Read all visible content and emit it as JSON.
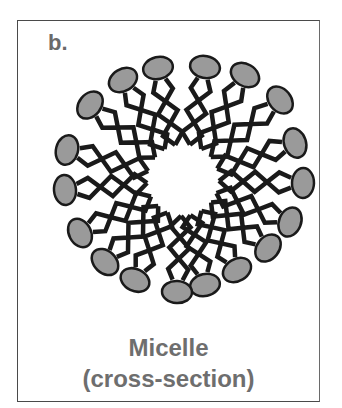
{
  "figure": {
    "panel_label": "b.",
    "caption_line1": "Micelle",
    "caption_line2": "(cross-section)"
  },
  "micelle": {
    "center": [
      183,
      180
    ],
    "head_color": "#9a9a9a",
    "outline_color": "#1a1a1a",
    "tail_color": "#1a1a1a",
    "heads": [
      [
        158,
        68
      ],
      [
        205,
        67
      ],
      [
        245,
        75
      ],
      [
        280,
        100
      ],
      [
        295,
        143
      ],
      [
        303,
        183
      ],
      [
        290,
        222
      ],
      [
        268,
        248
      ],
      [
        237,
        270
      ],
      [
        205,
        285
      ],
      [
        177,
        292
      ],
      [
        135,
        280
      ],
      [
        105,
        262
      ],
      [
        80,
        233
      ],
      [
        65,
        190
      ],
      [
        67,
        150
      ],
      [
        90,
        105
      ],
      [
        123,
        80
      ]
    ]
  },
  "colors": {
    "frame": "#4a4a4a",
    "text": "#6e6e6e",
    "background": "#ffffff"
  }
}
